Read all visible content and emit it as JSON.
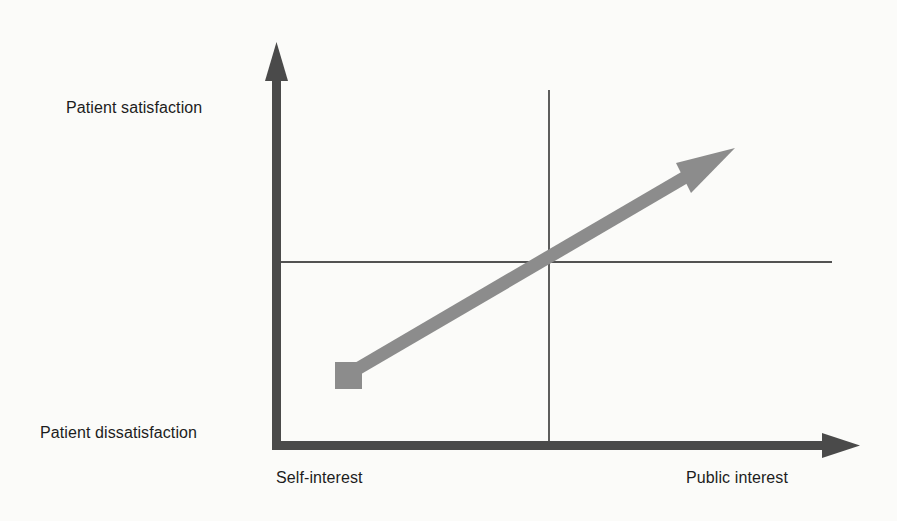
{
  "diagram": {
    "type": "quadrant-arrow-diagram",
    "y_axis": {
      "top_label": "Patient satisfaction",
      "bottom_label": "Patient dissatisfaction"
    },
    "x_axis": {
      "left_label": "Self-interest",
      "right_label": "Public interest"
    },
    "trend_arrow": {
      "from": "low self-interest / dissatisfaction (square marker)",
      "to": "high public interest / satisfaction (arrowhead)"
    },
    "colors": {
      "axis": "#4a4a4a",
      "trend_arrow": "#8c8c8c",
      "grid_lines": "#1a1a1a",
      "background": "#fbfbf9"
    }
  }
}
